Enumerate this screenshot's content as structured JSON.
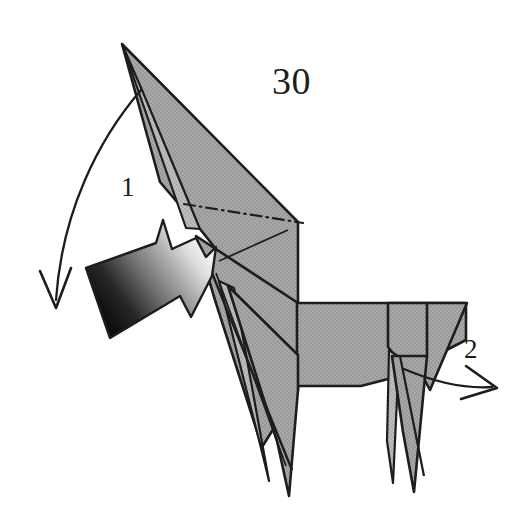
{
  "figure": {
    "kind": "origami-instruction-diagram",
    "background_color": "#ffffff",
    "ink_color": "#1d1d1d",
    "paper_fill_color": "#a3a3a3",
    "paper_fill_light": "#b9b9b9",
    "paper_edge_color": "#1d1d1d",
    "arrow_gradient_dark": "#141414",
    "arrow_gradient_light": "#ededed"
  },
  "labels": {
    "step_number": "30",
    "fold_one": "1",
    "fold_two": "2"
  },
  "annotations": {
    "step_number_name": "step-number",
    "fold_one_name": "fold-callout-1",
    "fold_two_name": "fold-callout-2"
  },
  "arrows": [
    {
      "id": "curved-arrow-1",
      "label": "1",
      "style": "thin-curved-open-head",
      "meaning": "fold head down to the left",
      "from": [
        140,
        90
      ],
      "to": [
        55,
        306
      ],
      "color": "#1d1d1d"
    },
    {
      "id": "push-arrow-1",
      "label": "1",
      "style": "solid-shaded-3d-arrow",
      "meaning": "push / reverse fold neck",
      "direction": "up-right",
      "gradient_from": "#141414",
      "gradient_to": "#f2f2f2"
    },
    {
      "id": "curved-arrow-2",
      "label": "2",
      "style": "thin-curved-open-head",
      "meaning": "fold tail out to the right",
      "from": [
        405,
        370
      ],
      "to": [
        496,
        387
      ],
      "color": "#1d1d1d"
    }
  ],
  "fold_lines": [
    {
      "id": "mountain-fold-neck",
      "pattern": "dash-dot",
      "from": [
        184,
        204
      ],
      "to": [
        303,
        223
      ]
    },
    {
      "id": "crease-neck-lower",
      "pattern": "solid",
      "from": [
        219,
        261
      ],
      "to": [
        288,
        230
      ]
    }
  ],
  "shapes": {
    "head_tip": [
      122,
      44
    ],
    "neck_right_edge_x": 298,
    "body_top_y": 303,
    "body_bottom_y": 386,
    "tail_tip": [
      467,
      303
    ],
    "front_leg_tips": [
      [
        266,
        487
      ],
      [
        288,
        495
      ]
    ],
    "rear_leg_tips": [
      [
        391,
        486
      ],
      [
        412,
        492
      ]
    ]
  }
}
